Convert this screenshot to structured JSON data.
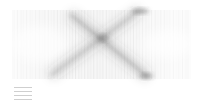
{
  "chart_data": {
    "type": "line",
    "title": "",
    "xlabel": "",
    "ylabel": "",
    "grid": false,
    "plot_area": {
      "x0": 13,
      "y0": 10,
      "x1": 190,
      "y1": 79
    },
    "vertical_line_count": 120,
    "bands": [
      {
        "name": "descending band",
        "from": [
          70,
          14
        ],
        "to": [
          148,
          77
        ],
        "intensity": 0.55
      },
      {
        "name": "ascending band",
        "from": [
          50,
          76
        ],
        "to": [
          140,
          10
        ],
        "intensity": 0.45
      }
    ],
    "crossing_point": [
      103,
      38
    ],
    "legend_position": "bottom-left",
    "legend": [
      "",
      "",
      ""
    ]
  },
  "colors": {
    "background": "#ffffff",
    "stroke": "#9a9a9a",
    "band": "#444444",
    "legend": "#cfcfcf"
  }
}
